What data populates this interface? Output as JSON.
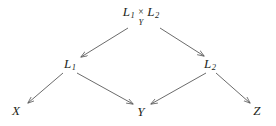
{
  "figure": {
    "kind": "commutative-diagram",
    "background_color": "#ffffff",
    "ink_color": "#231f20",
    "arrow_color": "#5a5a5a"
  },
  "nodes": {
    "fiber_product": {
      "left_factor": "L",
      "left_factor_sub": "1",
      "times": "×",
      "times_base": "Y",
      "right_factor": "L",
      "right_factor_sub": "2",
      "plain": "L1 ×Y L2",
      "x": 141,
      "y": 16
    },
    "l1": {
      "label": "L",
      "sub": "1",
      "plain": "L1",
      "x": 70,
      "y": 64
    },
    "l2": {
      "label": "L",
      "sub": "2",
      "plain": "L2",
      "x": 210,
      "y": 64
    },
    "x": {
      "label": "X",
      "sub": "",
      "plain": "X",
      "x": 16,
      "y": 110
    },
    "y": {
      "label": "Y",
      "sub": "",
      "plain": "Y",
      "x": 141,
      "y": 111
    },
    "z": {
      "label": "Z",
      "sub": "",
      "plain": "Z",
      "x": 257,
      "y": 110
    }
  },
  "arrows": [
    {
      "name": "fiber-product-to-l1",
      "from": "fiber_product",
      "to": "l1",
      "label": "",
      "x1": 128,
      "y1": 28,
      "x2": 81,
      "y2": 57
    },
    {
      "name": "fiber-product-to-l2",
      "from": "fiber_product",
      "to": "l2",
      "label": "",
      "x1": 160,
      "y1": 28,
      "x2": 204,
      "y2": 56
    },
    {
      "name": "l1-to-x",
      "from": "l1",
      "to": "x",
      "label": "",
      "x1": 63,
      "y1": 73,
      "x2": 28,
      "y2": 103
    },
    {
      "name": "l1-to-y",
      "from": "l1",
      "to": "y",
      "label": "",
      "x1": 77,
      "y1": 73,
      "x2": 133,
      "y2": 104
    },
    {
      "name": "l2-to-y",
      "from": "l2",
      "to": "y",
      "label": "",
      "x1": 206,
      "y1": 73,
      "x2": 151,
      "y2": 104
    },
    {
      "name": "l2-to-z",
      "from": "l2",
      "to": "z",
      "label": "",
      "x1": 216,
      "y1": 73,
      "x2": 250,
      "y2": 103
    }
  ]
}
